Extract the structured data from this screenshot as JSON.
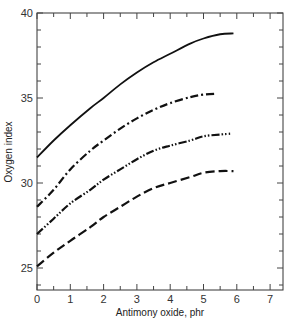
{
  "chart_data": {
    "type": "line",
    "title": "",
    "xlabel": "Antimony oxide, phr",
    "ylabel": "Oxygen index",
    "xlim": [
      0,
      7.4
    ],
    "ylim": [
      23.6,
      40
    ],
    "xticks": [
      0,
      1,
      2,
      3,
      4,
      5,
      6,
      7
    ],
    "yticks": [
      25,
      30,
      35,
      40
    ],
    "grid": false,
    "legend": null,
    "series": [
      {
        "name": "solid",
        "style": "solid",
        "x": [
          0,
          0.5,
          1,
          1.6,
          2,
          2.5,
          3,
          3.5,
          4,
          4.6,
          5,
          5.5,
          5.9
        ],
        "y": [
          31.5,
          32.5,
          33.4,
          34.4,
          35.0,
          35.8,
          36.5,
          37.1,
          37.6,
          38.2,
          38.5,
          38.75,
          38.8
        ]
      },
      {
        "name": "dash-dot",
        "style": "dashdot",
        "x": [
          0,
          0.5,
          1,
          1.6,
          2,
          2.5,
          3,
          3.5,
          4,
          4.6,
          5,
          5.4
        ],
        "y": [
          28.6,
          29.6,
          30.8,
          31.9,
          32.5,
          33.2,
          33.8,
          34.3,
          34.7,
          35.05,
          35.2,
          35.25
        ]
      },
      {
        "name": "dash-dot-dot",
        "style": "dashdotdot",
        "x": [
          0,
          0.5,
          1,
          1.6,
          2,
          2.5,
          3,
          3.5,
          4,
          4.6,
          5,
          5.5,
          5.8
        ],
        "y": [
          27.0,
          27.9,
          28.8,
          29.6,
          30.2,
          30.8,
          31.4,
          31.9,
          32.2,
          32.5,
          32.75,
          32.85,
          32.9
        ]
      },
      {
        "name": "dashed",
        "style": "dashed",
        "x": [
          0,
          0.5,
          1,
          1.6,
          2,
          2.5,
          3,
          3.5,
          4,
          4.6,
          5,
          5.5,
          5.9
        ],
        "y": [
          25.1,
          25.9,
          26.6,
          27.4,
          28.0,
          28.6,
          29.2,
          29.7,
          30.0,
          30.35,
          30.6,
          30.7,
          30.7
        ]
      }
    ]
  }
}
